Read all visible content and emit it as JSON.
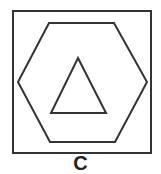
{
  "figure": {
    "caption": "C",
    "stroke_color": "#333333",
    "shapes": [
      {
        "name": "outer-square",
        "type": "square"
      },
      {
        "name": "hexagon",
        "type": "hexagon"
      },
      {
        "name": "inner-triangle",
        "type": "triangle"
      }
    ]
  }
}
